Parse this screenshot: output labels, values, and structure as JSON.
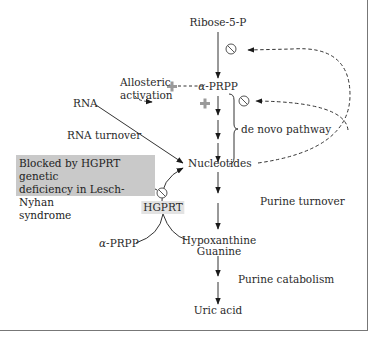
{
  "figure": {
    "nodes": {
      "ribose": "Ribose-5-P",
      "prpp_greek": "α",
      "prpp_rest": "-PRPP",
      "nucleotides": "Nucleotides",
      "rna": "RNA",
      "hgprt": "HGPRT",
      "prpp2_greek": "α",
      "prpp2_rest": "-PRPP",
      "hypoxanthine": "Hypoxanthine",
      "guanine": "Guanine",
      "uric_acid": "Uric acid"
    },
    "labels": {
      "allosteric_line1": "Allosteric",
      "allosteric_line2": "activation",
      "de_novo": "de novo pathway",
      "rna_turnover": "RNA turnover",
      "purine_turnover": "Purine turnover",
      "purine_catabolism": "Purine catabolism"
    },
    "note": {
      "line1": "Blocked by HGPRT genetic",
      "line2": "deficiency in Lesch-Nyhan",
      "line3": "syndrome"
    },
    "symbols": {
      "activation": "+",
      "inhibition": "⊘"
    },
    "colors": {
      "line": "#2a2a2a",
      "activation_plus": "#9a9a9a",
      "note_bg": "#c9c9c9",
      "hgprt_bg": "#e3e3e3",
      "frame": "#777777"
    }
  }
}
